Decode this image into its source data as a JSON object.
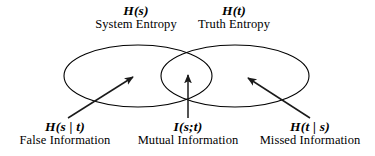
{
  "diagram": {
    "background_color": "#ffffff",
    "stroke_color": "#000000",
    "sets": [
      {
        "id": "system",
        "math_label": "H(s)",
        "description": "System Entropy",
        "cx": 138,
        "cy": 76,
        "rx": 74,
        "ry": 31
      },
      {
        "id": "truth",
        "math_label": "H(t)",
        "description": "Truth Entropy",
        "cx": 235,
        "cy": 76,
        "rx": 74,
        "ry": 31
      }
    ],
    "regions": [
      {
        "id": "false-information",
        "math_label": "H(s | t)",
        "description": "False Information",
        "arrow": {
          "x1": 68,
          "y1": 118,
          "x2": 133,
          "y2": 77
        }
      },
      {
        "id": "mutual-information",
        "math_label": "I(s;t)",
        "description": "Mutual Information",
        "arrow": {
          "x1": 188,
          "y1": 118,
          "x2": 188,
          "y2": 75
        }
      },
      {
        "id": "missed-information",
        "math_label": "H(t | s)",
        "description": "Missed Information",
        "arrow": {
          "x1": 310,
          "y1": 118,
          "x2": 248,
          "y2": 78
        }
      }
    ]
  }
}
